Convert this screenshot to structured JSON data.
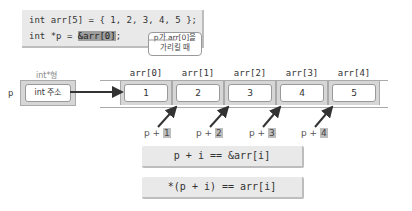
{
  "code": {
    "line1": "int arr[5] = { 1, 2, 3, 4, 5 };",
    "line2_prefix": "int *p = ",
    "line2_highlight": "&arr[0]",
    "line2_suffix": ";"
  },
  "callout": {
    "line1": "p가 arr[0]을",
    "line2": "가리킬 때"
  },
  "pointer": {
    "name": "p",
    "type_label": "int*형",
    "value": "int 주소"
  },
  "array": {
    "cells": [
      {
        "label": "arr[0]",
        "value": "1"
      },
      {
        "label": "arr[1]",
        "value": "2"
      },
      {
        "label": "arr[2]",
        "value": "3"
      },
      {
        "label": "arr[3]",
        "value": "4"
      },
      {
        "label": "arr[4]",
        "value": "5"
      }
    ]
  },
  "offsets": [
    {
      "prefix": "p + ",
      "num": "1"
    },
    {
      "prefix": "p + ",
      "num": "2"
    },
    {
      "prefix": "p + ",
      "num": "3"
    },
    {
      "prefix": "p + ",
      "num": "4"
    }
  ],
  "formulas": {
    "f1": "p + i == &arr[i]",
    "f2": "*(p + i) == arr[i]"
  }
}
